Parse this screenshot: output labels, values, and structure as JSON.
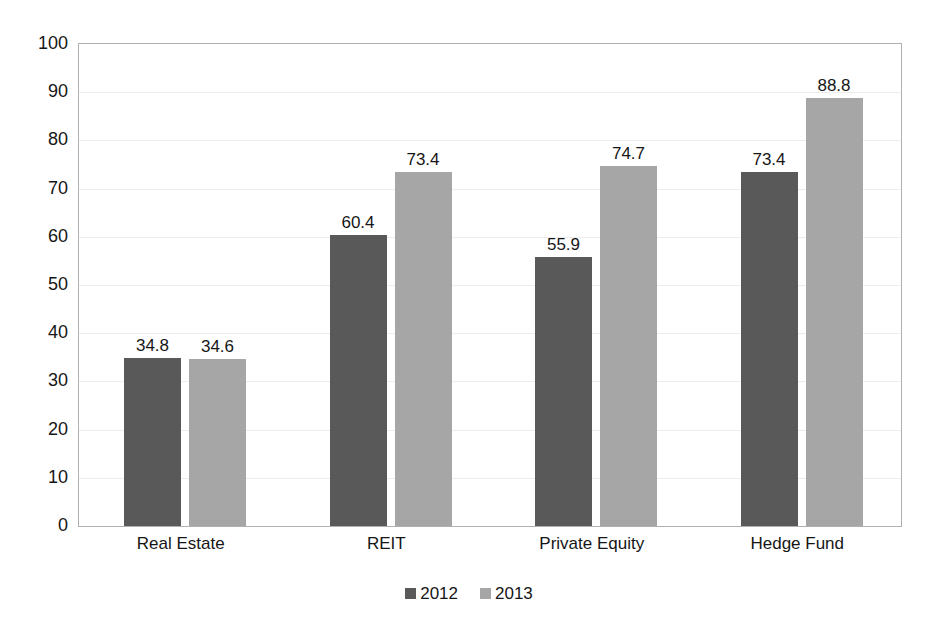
{
  "chart_data": {
    "type": "bar",
    "title": "",
    "subtitle": "",
    "xlabel": "",
    "ylabel": "",
    "categories": [
      "Real Estate",
      "REIT",
      "Private Equity",
      "Hedge Fund"
    ],
    "series": [
      {
        "name": "2012",
        "color": "#595959",
        "values": [
          34.8,
          60.4,
          55.9,
          73.4
        ]
      },
      {
        "name": "2013",
        "color": "#a6a6a6",
        "values": [
          34.6,
          73.4,
          74.7,
          88.8
        ]
      }
    ],
    "ylim": [
      0,
      100
    ],
    "ytick_step": 10,
    "yticks": [
      "0",
      "10",
      "20",
      "30",
      "40",
      "50",
      "60",
      "70",
      "80",
      "90",
      "100"
    ],
    "grid": true,
    "grid_axis": "y",
    "data_labels": true,
    "legend": {
      "position": "bottom",
      "entries": [
        {
          "label": "2012",
          "color": "#595959"
        },
        {
          "label": "2013",
          "color": "#a6a6a6"
        }
      ]
    },
    "colors": {
      "series_2012": "#595959",
      "series_2013": "#a6a6a6",
      "gridline": "#ededed",
      "plot_border": "#b0b0b0",
      "text": "#161616",
      "background": "#ffffff"
    }
  }
}
